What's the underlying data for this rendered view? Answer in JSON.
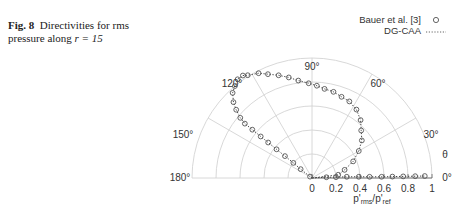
{
  "caption": {
    "fig_label": "Fig. 8",
    "text_line1": "Directivities for rms",
    "text_line2": "pressure along ",
    "math": "r = 15"
  },
  "legend": [
    {
      "label": "Bauer et al. [3]",
      "marker": "circle"
    },
    {
      "label": "DG-CAA",
      "marker": "dotted-line"
    }
  ],
  "chart_data": {
    "type": "line",
    "subtype": "polar",
    "title": "",
    "xlabel": "p'rms/p'ref",
    "theta_label": "θ",
    "angle_ticks": [
      "0°",
      "30°",
      "60°",
      "90°",
      "120°",
      "150°",
      "180°"
    ],
    "radial_ticks": [
      "0",
      "0.2",
      "0.4",
      "0.6",
      "0.8",
      "1"
    ],
    "rlim": [
      0,
      1
    ],
    "theta_range_deg": [
      0,
      180
    ],
    "grid": true,
    "legend_position": "top-right",
    "series": [
      {
        "name": "Bauer et al. [3]",
        "style": "circle-markers",
        "points_theta_deg_r": [
          [
            145,
            0.02
          ],
          [
            142,
            0.12
          ],
          [
            141,
            0.2
          ],
          [
            141,
            0.29
          ],
          [
            141,
            0.38
          ],
          [
            141,
            0.47
          ],
          [
            141,
            0.55
          ],
          [
            141,
            0.64
          ],
          [
            141,
            0.72
          ],
          [
            140,
            0.78
          ],
          [
            138,
            0.85
          ],
          [
            136,
            0.91
          ],
          [
            133,
            0.97
          ],
          [
            130,
            1.0
          ],
          [
            127,
            1.03
          ],
          [
            124,
            1.03
          ],
          [
            122,
            1.01
          ],
          [
            117,
            0.98
          ],
          [
            113,
            0.94
          ],
          [
            108,
            0.9
          ],
          [
            103,
            0.86
          ],
          [
            98,
            0.82
          ],
          [
            92,
            0.79
          ],
          [
            87,
            0.77
          ],
          [
            82,
            0.75
          ],
          [
            76,
            0.74
          ],
          [
            70,
            0.72
          ],
          [
            64,
            0.71
          ],
          [
            57,
            0.68
          ],
          [
            50,
            0.63
          ],
          [
            44,
            0.57
          ],
          [
            37,
            0.52
          ],
          [
            30,
            0.45
          ],
          [
            22,
            0.37
          ],
          [
            14,
            0.28
          ],
          [
            7,
            0.22
          ],
          [
            3,
            0.12
          ],
          [
            2,
            0.2
          ],
          [
            2,
            0.29
          ],
          [
            1.5,
            0.39
          ],
          [
            1.2,
            0.48
          ],
          [
            1,
            0.58
          ],
          [
            1,
            0.67
          ],
          [
            1,
            0.76
          ],
          [
            1,
            0.86
          ],
          [
            1,
            0.94
          ]
        ]
      },
      {
        "name": "DG-CAA",
        "style": "dotted-line",
        "same_curve_as": "Bauer et al. [3]"
      }
    ]
  }
}
